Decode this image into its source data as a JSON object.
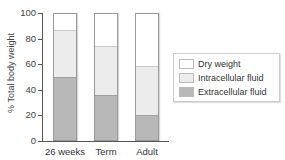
{
  "chart_data": {
    "type": "bar",
    "stacked": true,
    "title": "",
    "xlabel": "",
    "ylabel": "% Total body weight",
    "ylim": [
      0,
      100
    ],
    "yticks": [
      0,
      20,
      40,
      60,
      80,
      100
    ],
    "categories": [
      "26 weeks",
      "Term",
      "Adult"
    ],
    "series": [
      {
        "name": "Extracellular fluid",
        "values": [
          50,
          36,
          20
        ],
        "color": "#b8b8b8"
      },
      {
        "name": "Intracellular fluid",
        "values": [
          37,
          39,
          39
        ],
        "color": "#ececec"
      },
      {
        "name": "Dry weight",
        "values": [
          13,
          25,
          41
        ],
        "color": "#ffffff"
      }
    ],
    "legend": {
      "position": "right",
      "entries": [
        "Dry weight",
        "Intracellular fluid",
        "Extracellular fluid"
      ]
    },
    "grid": false
  },
  "axis": {
    "ylabel": "% Total body weight",
    "ticks": [
      "0",
      "20",
      "40",
      "60",
      "80",
      "100"
    ]
  },
  "legend": {
    "items": [
      {
        "label": "Dry weight",
        "color": "#ffffff"
      },
      {
        "label": "Intracellular fluid",
        "color": "#ececec"
      },
      {
        "label": "Extracellular fluid",
        "color": "#b8b8b8"
      }
    ]
  },
  "bars": [
    {
      "label": "26 weeks",
      "dry": 13,
      "icf": 37,
      "ecf": 50
    },
    {
      "label": "Term",
      "dry": 25,
      "icf": 39,
      "ecf": 36
    },
    {
      "label": "Adult",
      "dry": 41,
      "icf": 39,
      "ecf": 20
    }
  ]
}
